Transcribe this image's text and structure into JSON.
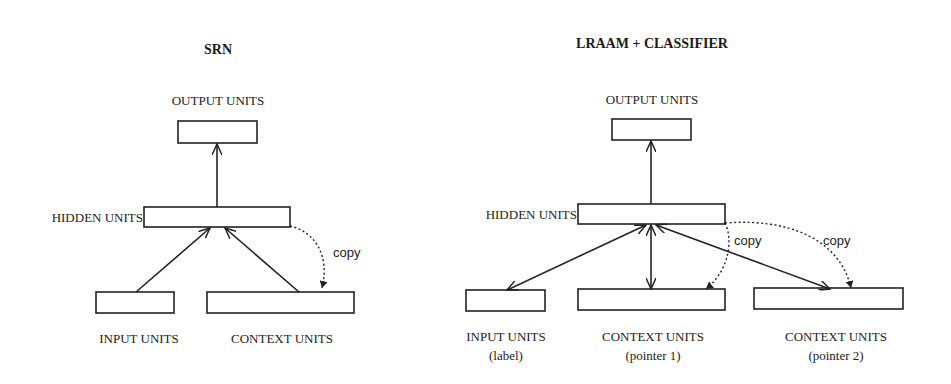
{
  "diagrams": [
    {
      "title": "SRN",
      "layers": {
        "output": {
          "label": "OUTPUT UNITS"
        },
        "hidden": {
          "label": "HIDDEN UNITS"
        },
        "input": {
          "label": "INPUT UNITS"
        },
        "context": {
          "label": "CONTEXT UNITS"
        }
      },
      "copy_label": "copy",
      "connections": [
        {
          "from": "input",
          "to": "hidden",
          "type": "arrow"
        },
        {
          "from": "context",
          "to": "hidden",
          "type": "arrow"
        },
        {
          "from": "hidden",
          "to": "output",
          "type": "arrow"
        },
        {
          "from": "hidden",
          "to": "context",
          "type": "dotted-copy"
        }
      ]
    },
    {
      "title": "LRAAM + CLASSIFIER",
      "layers": {
        "output": {
          "label": "OUTPUT UNITS"
        },
        "hidden": {
          "label": "HIDDEN UNITS"
        },
        "input": {
          "label": "INPUT UNITS",
          "sublabel": "(label)"
        },
        "context1": {
          "label": "CONTEXT UNITS",
          "sublabel": "(pointer 1)"
        },
        "context2": {
          "label": "CONTEXT UNITS",
          "sublabel": "(pointer 2)"
        }
      },
      "copy_labels": [
        "copy",
        "copy"
      ],
      "connections": [
        {
          "from": "hidden",
          "to": "output",
          "type": "arrow"
        },
        {
          "from": "hidden",
          "to": "input",
          "type": "bidirectional"
        },
        {
          "from": "hidden",
          "to": "context1",
          "type": "bidirectional"
        },
        {
          "from": "hidden",
          "to": "context2",
          "type": "bidirectional"
        },
        {
          "from": "hidden",
          "to": "context1",
          "type": "dotted-copy"
        },
        {
          "from": "hidden",
          "to": "context2",
          "type": "dotted-copy"
        }
      ]
    }
  ]
}
